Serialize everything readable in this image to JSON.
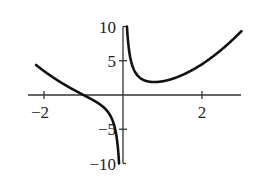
{
  "chart_data": {
    "type": "line",
    "title": "",
    "xlabel": "",
    "ylabel": "",
    "function": "f(x) = x^2 + 1/x",
    "xlim": [
      -2.2,
      3.0
    ],
    "ylim": [
      -10,
      10
    ],
    "x_ticks": [
      -2,
      2
    ],
    "x_tick_labels": [
      "−2",
      "2"
    ],
    "y_ticks": [
      10,
      5,
      -5,
      -10
    ],
    "y_tick_labels": [
      "10",
      "5",
      "−5",
      "−10"
    ],
    "grid": false,
    "legend": null,
    "vertical_asymptote": 0,
    "series": [
      {
        "name": "f(x)",
        "color": "#111111",
        "x": [
          -2.2,
          -2,
          -1.5,
          -1,
          -0.5,
          -0.25,
          -0.1
        ],
        "y": [
          4.39,
          3.5,
          1.58,
          0,
          -1.75,
          -3.94,
          -9.99
        ]
      },
      {
        "name": "f(x)",
        "color": "#111111",
        "x": [
          0.1,
          0.25,
          0.5,
          0.79,
          1,
          1.5,
          2,
          2.5,
          3
        ],
        "y": [
          10.01,
          4.06,
          2.25,
          1.89,
          2,
          2.92,
          4.5,
          6.65,
          9.33
        ]
      }
    ]
  }
}
